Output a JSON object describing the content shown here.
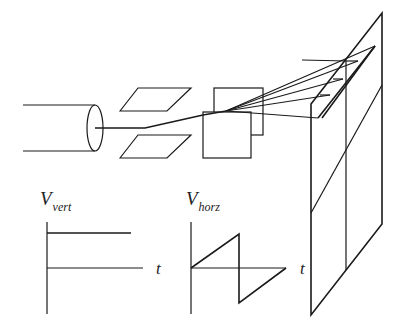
{
  "diagram": {
    "components": {
      "electron_gun": "cylinder",
      "vertical_deflection_plates": "horizontal parallel plates",
      "horizontal_deflection_plates": "vertical parallel plates",
      "screen": "phosphor screen with 2x2 grid"
    },
    "labels": {
      "v_vert_main": "V",
      "v_vert_sub": "vert",
      "v_horz_main": "V",
      "v_horz_sub": "horz",
      "t_vert": "t",
      "t_horz": "t"
    },
    "graphs": [
      {
        "name": "vertical-voltage",
        "shape": "constant",
        "description": "constant positive voltage vs time"
      },
      {
        "name": "horizontal-voltage",
        "shape": "sawtooth",
        "description": "linear ramp up, drop to negative, ramp up to zero"
      }
    ],
    "colors": {
      "stroke": "#1a1a1a",
      "background": "#ffffff"
    }
  }
}
